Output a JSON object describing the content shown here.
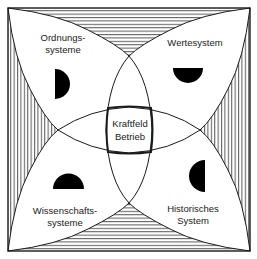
{
  "diagram": {
    "type": "four-field overlapping circles diagram",
    "center": {
      "label_line1": "Kraftfeld",
      "label_line2": "Betrieb"
    },
    "quadrants": [
      {
        "position": "top-left",
        "label_line1": "Ordnungs-",
        "label_line2": "systeme",
        "half_disc": "right-half"
      },
      {
        "position": "top-right",
        "label_line1": "Wertesystem",
        "label_line2": "",
        "half_disc": "bottom-half"
      },
      {
        "position": "bottom-left",
        "label_line1": "Wissenschafts-",
        "label_line2": "systeme",
        "half_disc": "top-half"
      },
      {
        "position": "bottom-right",
        "label_line1": "Historisches",
        "label_line2": "System",
        "half_disc": "left-half"
      }
    ],
    "colors": {
      "line": "#1a1a1a",
      "fill": "#000000",
      "background": "#ffffff"
    }
  }
}
